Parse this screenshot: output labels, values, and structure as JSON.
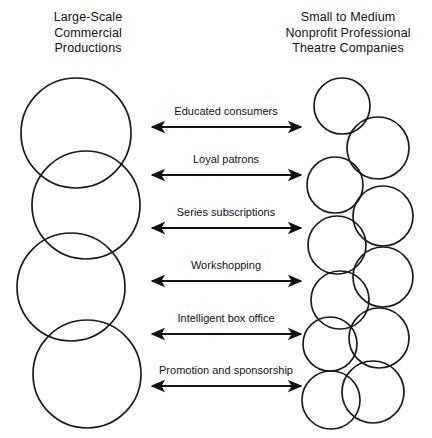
{
  "figure": {
    "left_column": {
      "heading": "Large-Scale\nCommercial\nProductions",
      "circle_count": 4,
      "circle_style": "large overlapping outlined circles"
    },
    "right_column": {
      "heading": "Small to Medium\nNonprofit Professional\nTheatre Companies",
      "circle_count": 11,
      "circle_style": "small staggered overlapping outlined circles"
    },
    "arrows": [
      {
        "label": "Educated consumers",
        "direction": "bidirectional"
      },
      {
        "label": "Loyal patrons",
        "direction": "bidirectional"
      },
      {
        "label": "Series subscriptions",
        "direction": "bidirectional"
      },
      {
        "label": "Workshopping",
        "direction": "bidirectional"
      },
      {
        "label": "Intelligent box office",
        "direction": "bidirectional"
      },
      {
        "label": "Promotion and sponsorship",
        "direction": "bidirectional"
      }
    ],
    "colors": {
      "background": "#ffffff",
      "stroke": "#1a1a1a",
      "text": "#121212"
    }
  }
}
